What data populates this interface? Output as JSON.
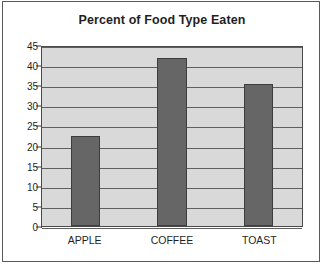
{
  "chart_data": {
    "type": "bar",
    "title": "Percent of Food Type Eaten",
    "xlabel": "",
    "ylabel": "",
    "categories": [
      "APPLE",
      "COFFEE",
      "TOAST"
    ],
    "values": [
      22.4,
      41.8,
      35.2
    ],
    "ylim": [
      0,
      45
    ],
    "ytick_step": 5,
    "yticks": [
      45,
      40,
      35,
      30,
      25,
      20,
      15,
      10,
      5,
      0
    ],
    "ytick_labels": [
      "45",
      "40",
      "35",
      "30",
      "25",
      "20",
      "15",
      "10",
      "5",
      "0"
    ],
    "grid": true,
    "grid_axis": "y",
    "legend": false,
    "legend_position": "none",
    "colors": {
      "bar_fill": "#666666",
      "bar_border": "#3d3d3d",
      "plot_background": "#d9d9d9",
      "gridline": "#5f5f5f",
      "axis": "#3d3d3d",
      "text": "#1f1f1f",
      "frame": "#5a5a5a",
      "page_background": "#ffffff"
    }
  }
}
